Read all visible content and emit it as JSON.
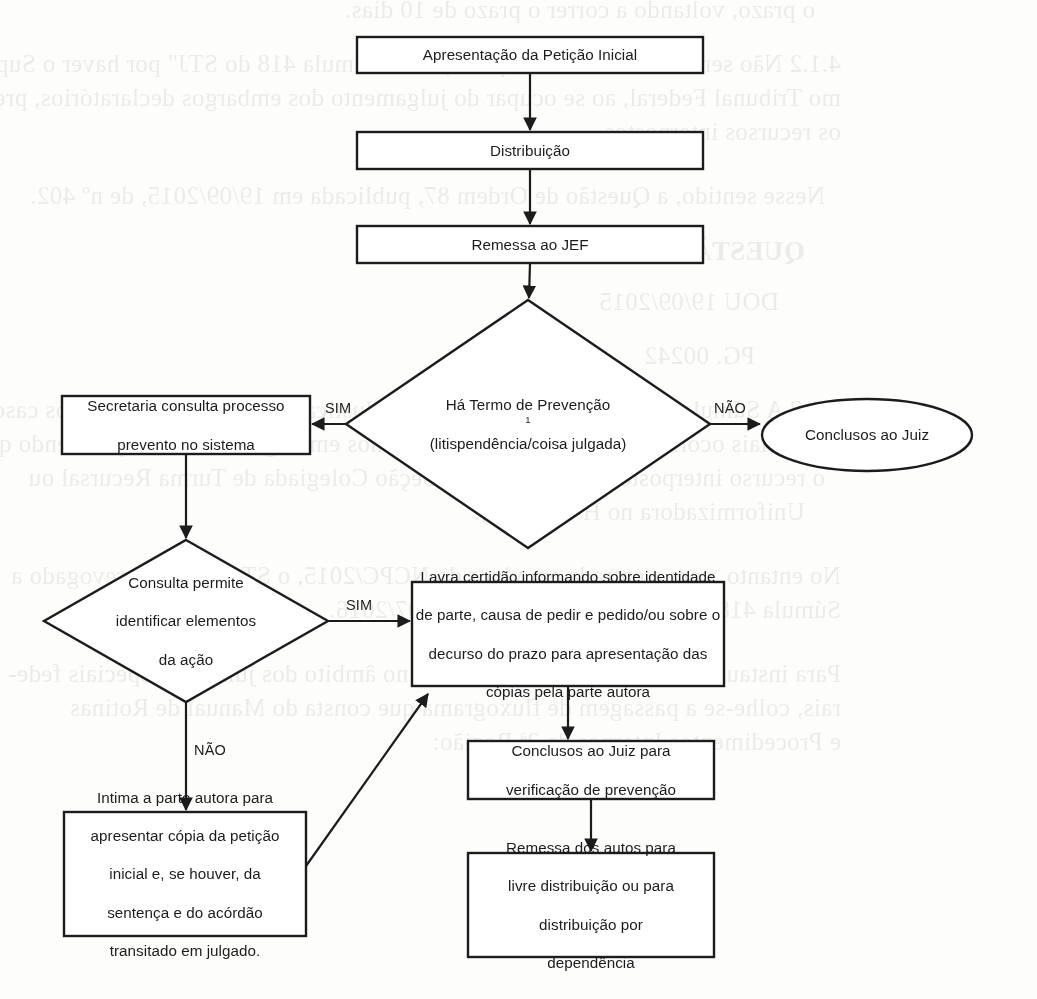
{
  "document": {
    "type": "flowchart",
    "language": "pt-BR",
    "title": "Fluxograma de verificação de prevenção no JEF",
    "stroke_color": "#1c1c1c",
    "fill_color": "#ffffff",
    "text_color": "#1c1c1c"
  },
  "nodes": {
    "peticao_inicial": {
      "label": "Apresentação da Petição Inicial",
      "shape": "rectangle"
    },
    "distribuicao": {
      "label": "Distribuição",
      "shape": "rectangle"
    },
    "remessa_jef": {
      "label": "Remessa ao JEF",
      "shape": "rectangle"
    },
    "decisao_prevencao": {
      "shape": "diamond",
      "line1": "Há Termo de Prevenção",
      "footnote": "1",
      "line2": "(litispendência/coisa julgada)"
    },
    "secretaria_consulta": {
      "shape": "rectangle",
      "line1": "Secretaria consulta processo",
      "line2": "prevento no sistema"
    },
    "conclusos_juiz": {
      "label": "Conclusos ao Juiz",
      "shape": "ellipse"
    },
    "decisao_consulta": {
      "shape": "diamond",
      "line1": "Consulta permite",
      "line2": "identificar elementos",
      "line3": "da ação"
    },
    "lavra_certidao": {
      "shape": "rectangle",
      "line1": "Lavra certidão informando sobre identidade",
      "line2": "de parte, causa de pedir e pedido/ou sobre o",
      "line3": "decurso do prazo para apresentação das",
      "line4": "cópias pela parte autora"
    },
    "intima_parte": {
      "shape": "rectangle",
      "line1": "Intima a parte autora para",
      "line2": "apresentar cópia da petição",
      "line3": "inicial e, se houver, da",
      "line4": "sentença e do acórdão",
      "line5": "transitado em julgado."
    },
    "conclusos_verificacao": {
      "shape": "rectangle",
      "line1": "Conclusos ao Juiz para",
      "line2": "verificação de prevenção"
    },
    "remessa_autos": {
      "shape": "rectangle",
      "line1": "Remessa dos autos para",
      "line2": "livre distribuição ou para",
      "line3": "distribuição por",
      "line4": "dependência"
    }
  },
  "edge_labels": {
    "prevencao_sim": "SIM",
    "prevencao_nao": "NÃO",
    "consulta_sim": "SIM",
    "consulta_nao": "NÃO"
  },
  "bleed_text": [
    "o prazo, voltando a correr o prazo de 10 dias.",
    "4.1.2 Não seria desarrazoada a aplicação da Súmula 418 do STJ\" por haver o Supre-",
    "mo Tribunal Federal, ao se ocupar do julgamento dos embargos declaratórios, prejudicar",
    "os recursos interpostos.",
    "Nesse sentido, a Questão de Ordem 87, publicada em 19/09/2015, de nº 402.",
    "QUESTÃO DE ORDEM Nº 402",
    "DOU 19/09/2015",
    "PG. 00242",
    "4.1.3 A Súmula 418 do Superior Tribunal de Justiça não é mais aplicável aos casos",
    "especiais ocorridos a partir do julgamento nos embargos de declaração, sendo que",
    "o recurso interposto antes será, no 2º Seção Colegiada de Turma Recursal ou",
    "Uniformizadora no H-1390/15).",
    "No entanto, com a entrada em vigor do NCPC/2015, o STJ cancelou revogado a",
    "Súmula 418 na sessão da 2ª Seção de 1º/07/2016.",
    "Para instaurar o procedimento em apreço no âmbito dos juizados especiais fede-",
    "rais, colhe-se a passagem de fluxograma que consta do Manual de Rotinas",
    "e Procedimentos Internos da 2ª Região:"
  ]
}
